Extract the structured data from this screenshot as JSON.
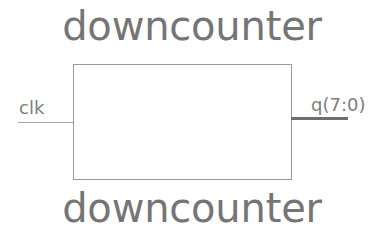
{
  "diagram": {
    "kind": "rtl-block-symbol",
    "entity_name_top": "downcounter",
    "entity_name_bottom": "downcounter",
    "colors": {
      "background": "#ffffff",
      "entity_label": "#757575",
      "box_border": "#9b9b9b",
      "port_label": "#7d7d7d",
      "signal_wire": "#a3a3a3",
      "bus_wire": "#6e6e6e"
    },
    "ports": {
      "inputs": [
        {
          "name": "clk",
          "label": "clk",
          "side": "left",
          "type": "signal"
        }
      ],
      "outputs": [
        {
          "name": "q",
          "label": "q(7:0)",
          "side": "right",
          "type": "bus",
          "width": 8,
          "msb": 7,
          "lsb": 0
        }
      ]
    }
  }
}
